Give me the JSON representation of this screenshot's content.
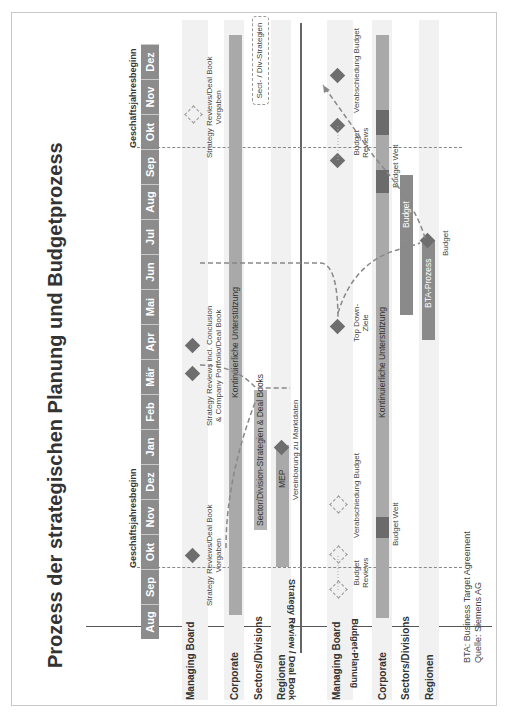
{
  "title": "Prozess der strategischen Planung und Budgetprozess",
  "fiscal_year_start_label": "Geschäftsjahresbeginn",
  "months": [
    "Aug",
    "Sep",
    "Okt",
    "Nov",
    "Dez",
    "Jan",
    "Feb",
    "Mär",
    "Apr",
    "Mai",
    "Jun",
    "Jul",
    "Aug",
    "Sep",
    "Okt",
    "Nov",
    "Dez"
  ],
  "sections": {
    "strategy": {
      "label": "Strategy Review / Deal Book",
      "rows": [
        "Managing Board",
        "Corporate",
        "Sectors/Divisions",
        "Regionen"
      ]
    },
    "budget": {
      "label": "Budget-Planung",
      "rows": [
        "Managing Board",
        "Corporate",
        "Sectors/Divisions",
        "Regionen"
      ]
    }
  },
  "strategy_items": {
    "mb_vorgaben_1": [
      "Strategy Reviews/Deal Book",
      "Vorgaben"
    ],
    "mb_conclusion": [
      "Strategy Reviews incl. Conclusion",
      "& Company Portfolio/Deal Book"
    ],
    "mb_vorgaben_2": [
      "Strategy Reviews/Deal Book",
      "Vorgaben"
    ],
    "corporate_bar": "Kontinuierliche Unterstützung",
    "sectors_bar": "Sector/Division-Strategien & Deal Books",
    "sectors_next": "Sect- / Div-Strategien",
    "regionen_bar": "MEP",
    "regionen_milestone": "Vereinbarung zu Marktdaten"
  },
  "budget_items": {
    "mb_reviews_1": [
      "Budget",
      "Reviews"
    ],
    "mb_approval_1": "Verabschiedung Budget",
    "mb_topdown": [
      "Top Down-",
      "Ziele"
    ],
    "mb_reviews_2": [
      "Budget",
      "Reviews"
    ],
    "mb_approval_2": "Verabschiedung Budget",
    "corporate_bar": "Kontinuierliche Unterstützung",
    "corporate_seg_1": "Budget Welt",
    "corporate_seg_2": "Budget Welt",
    "sectors_bar": "Budget",
    "regionen_bar": "BTA-Prozess",
    "regionen_milestone": "Budget"
  },
  "footnotes": {
    "line1": "BTA: Business Target Agreement",
    "line2": "Quelle: Siemens AG"
  }
}
